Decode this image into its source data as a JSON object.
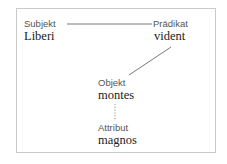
{
  "diagram": {
    "type": "sentence-structure",
    "nodes": [
      {
        "id": "subjekt",
        "role": "Subjekt",
        "word": "Liberi"
      },
      {
        "id": "praedikat",
        "role": "Prädikat",
        "word": "vident"
      },
      {
        "id": "objekt",
        "role": "Objekt",
        "word": "montes"
      },
      {
        "id": "attribut",
        "role": "Attribut",
        "word": "magnos"
      }
    ],
    "edges": [
      {
        "from": "subjekt",
        "to": "praedikat",
        "style": "solid"
      },
      {
        "from": "praedikat",
        "to": "objekt",
        "style": "solid"
      },
      {
        "from": "objekt",
        "to": "attribut",
        "style": "dotted"
      }
    ],
    "colors": {
      "border": "#c9c9c9",
      "line": "#555555",
      "role_text": "#555555",
      "word_text": "#222222"
    }
  }
}
